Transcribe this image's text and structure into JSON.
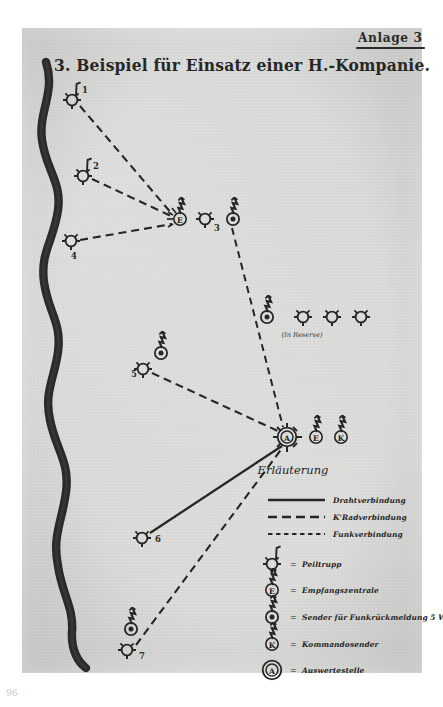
{
  "document": {
    "annex_label": "Anlage 3",
    "title": "3. Beispiel für Einsatz einer H.-Kompanie.",
    "page_number": "96"
  },
  "map": {
    "river_name": "river-line",
    "reserve_note": "(In Reserve)",
    "nodes": [
      {
        "id": "1",
        "type": "peiltrupp",
        "label": "1",
        "x": 72,
        "y": 100
      },
      {
        "id": "2",
        "type": "peiltrupp",
        "label": "2",
        "x": 83,
        "y": 176
      },
      {
        "id": "4",
        "type": "peiltrupp",
        "label": "4",
        "x": 71,
        "y": 241
      },
      {
        "id": "3",
        "type": "peiltrupp",
        "label": "3",
        "x": 205,
        "y": 219
      },
      {
        "id": "5",
        "type": "peiltrupp",
        "label": "5",
        "x": 143,
        "y": 369
      },
      {
        "id": "6",
        "type": "peiltrupp",
        "label": "6",
        "x": 142,
        "y": 538
      },
      {
        "id": "7",
        "type": "peiltrupp",
        "label": "7",
        "x": 127,
        "y": 650
      },
      {
        "id": "E1",
        "type": "empfangszentrale",
        "label": "E",
        "x": 180,
        "y": 219
      },
      {
        "id": "S1",
        "type": "sender",
        "label": "",
        "x": 233,
        "y": 219
      },
      {
        "id": "S5",
        "type": "sender",
        "label": "",
        "x": 161,
        "y": 353
      },
      {
        "id": "S7",
        "type": "sender",
        "label": "",
        "x": 131,
        "y": 629
      },
      {
        "id": "A",
        "type": "auswertestelle",
        "label": "A",
        "x": 287,
        "y": 437
      },
      {
        "id": "E2",
        "type": "empfangszentrale",
        "label": "E",
        "x": 316,
        "y": 437
      },
      {
        "id": "K",
        "type": "kommandosender",
        "label": "K",
        "x": 341,
        "y": 437
      },
      {
        "id": "R0",
        "type": "sender",
        "label": "",
        "x": 267,
        "y": 317
      },
      {
        "id": "R1",
        "type": "peiltrupp",
        "label": "",
        "x": 303,
        "y": 317
      },
      {
        "id": "R2",
        "type": "peiltrupp",
        "label": "",
        "x": 332,
        "y": 317
      },
      {
        "id": "R3",
        "type": "peiltrupp",
        "label": "",
        "x": 361,
        "y": 317
      }
    ],
    "links": [
      {
        "from": "1",
        "to": "E1",
        "kind": "kradverbindung"
      },
      {
        "from": "2",
        "to": "E1",
        "kind": "kradverbindung"
      },
      {
        "from": "4",
        "to": "E1",
        "kind": "kradverbindung"
      },
      {
        "from": "S1",
        "to": "A",
        "kind": "funkverbindung"
      },
      {
        "from": "5",
        "to": "A",
        "kind": "kradverbindung"
      },
      {
        "from": "6",
        "to": "A",
        "kind": "drahtverbindung"
      },
      {
        "from": "7",
        "to": "A",
        "kind": "kradverbindung"
      }
    ]
  },
  "legend": {
    "heading": "Erläuterung",
    "lines": [
      {
        "kind": "drahtverbindung",
        "label": "Drahtverbindung"
      },
      {
        "kind": "kradverbindung",
        "label": "K'Radverbindung"
      },
      {
        "kind": "funkverbindung",
        "label": "Funkverbindung"
      }
    ],
    "equals": "=",
    "symbols": [
      {
        "type": "peiltrupp",
        "glyph": "",
        "label": "Peiltrupp"
      },
      {
        "type": "empfangszentrale",
        "glyph": "E",
        "label": "Empfangszentrale"
      },
      {
        "type": "sender",
        "glyph": "",
        "label": "Sender für Funkrückmeldung   5 Watt"
      },
      {
        "type": "kommandosender",
        "glyph": "K",
        "label": "Kommandosender"
      },
      {
        "type": "auswertestelle",
        "glyph": "A",
        "label": "Auswertestelle"
      }
    ]
  },
  "colors": {
    "ink": "#262626",
    "paper": "#d8d8d6",
    "river": "#2c2a28"
  }
}
